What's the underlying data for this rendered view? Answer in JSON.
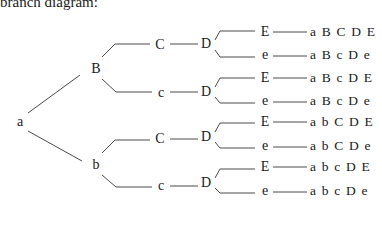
{
  "title": "branch diagram:",
  "root": {
    "label": "a",
    "x": 20,
    "y": 122
  },
  "level1": [
    {
      "label": "B",
      "x": 96,
      "y": 69
    },
    {
      "label": "b",
      "x": 96,
      "y": 165
    }
  ],
  "level2": [
    {
      "label": "C",
      "x": 160,
      "y": 45
    },
    {
      "label": "c",
      "x": 161,
      "y": 93
    },
    {
      "label": "C",
      "x": 160,
      "y": 139
    },
    {
      "label": "c",
      "x": 161,
      "y": 186
    }
  ],
  "level3": [
    {
      "label": "D",
      "x": 206,
      "y": 44
    },
    {
      "label": "D",
      "x": 206,
      "y": 92
    },
    {
      "label": "D",
      "x": 206,
      "y": 137
    },
    {
      "label": "D",
      "x": 206,
      "y": 183
    }
  ],
  "level4": [
    {
      "label": "E",
      "x": 265,
      "y": 32
    },
    {
      "label": "e",
      "x": 265,
      "y": 55
    },
    {
      "label": "E",
      "x": 265,
      "y": 78
    },
    {
      "label": "e",
      "x": 265,
      "y": 101
    },
    {
      "label": "E",
      "x": 265,
      "y": 122
    },
    {
      "label": "e",
      "x": 265,
      "y": 146
    },
    {
      "label": "E",
      "x": 265,
      "y": 167
    },
    {
      "label": "e",
      "x": 265,
      "y": 191
    }
  ],
  "outcomes": [
    {
      "label": "a B C D E",
      "y": 32
    },
    {
      "label": "a B c D e",
      "y": 55
    },
    {
      "label": "a B c D E",
      "y": 78
    },
    {
      "label": "a B c D e",
      "y": 101
    },
    {
      "label": "a b C D E",
      "y": 122
    },
    {
      "label": "a b C D e",
      "y": 146
    },
    {
      "label": "a b c D E",
      "y": 167
    },
    {
      "label": "a b c D e",
      "y": 191
    }
  ],
  "outcome_x": 310
}
